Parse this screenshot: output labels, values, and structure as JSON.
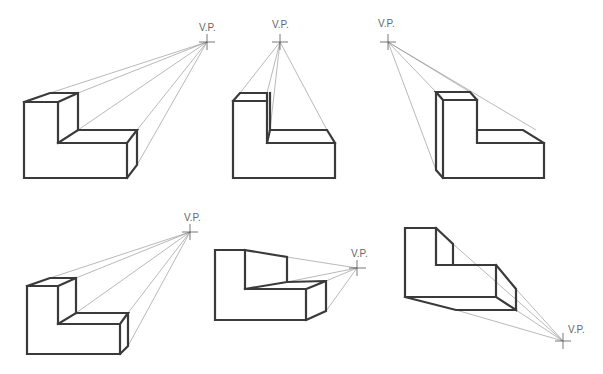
{
  "diagram": {
    "vp_label": "V.P.",
    "colors": {
      "edge": "#3a3a3a",
      "projection": "#8a8a8a",
      "label": "#666666"
    },
    "figures": [
      {
        "id": "fig-1",
        "description": "L-shaped block, vanishing point upper right",
        "vp": {
          "label": "V.P.",
          "x": 207,
          "y": 42
        }
      },
      {
        "id": "fig-2",
        "description": "L-shaped block, vanishing point directly above",
        "vp": {
          "label": "V.P.",
          "x": 280,
          "y": 42
        }
      },
      {
        "id": "fig-3",
        "description": "L-shaped block, vanishing point upper left",
        "vp": {
          "label": "V.P.",
          "x": 388,
          "y": 42
        }
      },
      {
        "id": "fig-4",
        "description": "L-shaped block, vanishing point upper right (lower row)",
        "vp": {
          "label": "V.P.",
          "x": 190,
          "y": 232
        }
      },
      {
        "id": "fig-5",
        "description": "L-shaped block, vanishing point to the right at mid height",
        "vp": {
          "label": "V.P.",
          "x": 357,
          "y": 268
        }
      },
      {
        "id": "fig-6",
        "description": "L-shaped block, vanishing point lower right",
        "vp": {
          "label": "V.P.",
          "x": 563,
          "y": 341
        }
      }
    ]
  }
}
